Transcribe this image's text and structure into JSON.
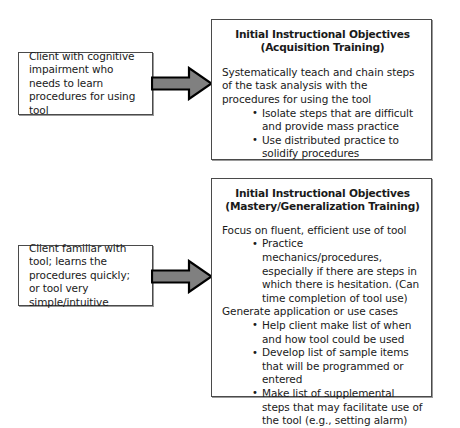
{
  "diagram": {
    "colors": {
      "background": "#ffffff",
      "box_border": "#4a4a4a",
      "arrow_fill": "#808080",
      "arrow_stroke": "#000000",
      "text": "#1a1a1a"
    },
    "flows": [
      {
        "id": "acquisition",
        "client": {
          "label": "Client with cognitive impairment who needs to learn procedures for using tool"
        },
        "arrow": {
          "icon": "right-arrow-icon",
          "direction": "right"
        },
        "objectives": {
          "title": "Initial Instructional Objectives\n(Acquisition Training)",
          "lead": "Systematically teach and chain steps of the task analysis with the procedures for using the tool",
          "bullets": [
            "Isolate steps that are difficult and provide mass practice",
            "Use distributed practice to solidify procedures"
          ]
        }
      },
      {
        "id": "mastery",
        "client": {
          "label": "Client familiar with tool; learns the procedures quickly; or tool very simple/intuitive"
        },
        "arrow": {
          "icon": "right-arrow-icon",
          "direction": "right"
        },
        "objectives": {
          "title": "Initial Instructional Objectives\n(Mastery/Generalization Training)",
          "lead": "Focus on fluent, efficient use of tool",
          "bullets": [
            "Practice mechanics/procedures, especially if there are steps in which there is hesitation. (Can time completion of tool use)"
          ],
          "lead2": "Generate application or use cases",
          "bullets2": [
            "Help client make list of when and how tool could be used",
            "Develop list of sample items that will be programmed or entered",
            "Make list of supplemental steps that may facilitate use of the tool (e.g., setting alarm)"
          ]
        }
      }
    ]
  }
}
